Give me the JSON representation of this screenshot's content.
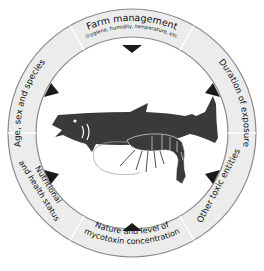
{
  "diagram": {
    "colors": {
      "ring_fill": "#ececec",
      "ring_stroke": "#8a8a8a",
      "arrow": "#1a1a1a",
      "fish": "#3a3a3a",
      "shrimp": "#3a3a3a"
    },
    "segments": [
      {
        "id": "farm-management",
        "label": "Farm management",
        "sublabel": "(hygiene, humidity, temperature, etc."
      },
      {
        "id": "duration-of-exposure",
        "label": "Duration of exposure"
      },
      {
        "id": "other-toxic-entities",
        "label": "Other toxic entities"
      },
      {
        "id": "nature-level-mycotoxin",
        "label_line1": "Nature and level of",
        "label_line2": "mycotoxin concentration"
      },
      {
        "id": "nutritional-health-status",
        "label_line1": "Nutritional",
        "label_line2": "and health status"
      },
      {
        "id": "age-sex-species",
        "label": "Age, sex and species"
      }
    ],
    "center": {
      "illustrations": [
        "fish-icon",
        "shrimp-icon"
      ]
    }
  }
}
